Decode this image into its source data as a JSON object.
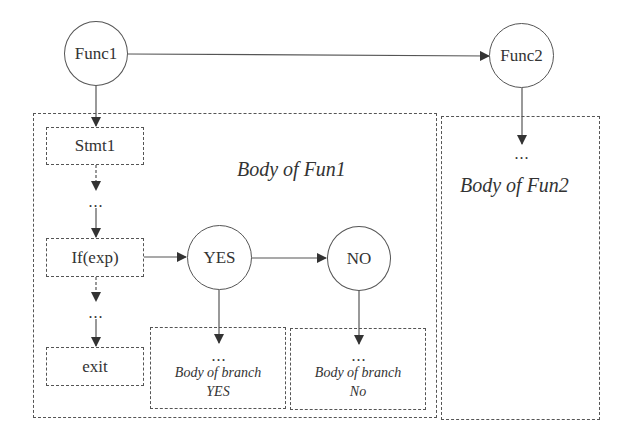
{
  "diagram": {
    "type": "function-call-flow",
    "nodes": {
      "func1": {
        "label": "Func1",
        "shape": "circle"
      },
      "func2": {
        "label": "Func2",
        "shape": "circle"
      },
      "yes": {
        "label": "YES",
        "shape": "circle"
      },
      "no": {
        "label": "NO",
        "shape": "circle"
      },
      "stmt1": {
        "label": "Stmt1",
        "shape": "dashed-rect"
      },
      "if_exp": {
        "label": "If(exp)",
        "shape": "dashed-rect"
      },
      "exit": {
        "label": "exit",
        "shape": "dashed-rect"
      }
    },
    "regions": {
      "body_fun1": {
        "label": "Body of Fun1"
      },
      "body_fun2": {
        "label": "Body of Fun2",
        "ellipsis": "..."
      },
      "branch_yes": {
        "ellipsis": "...",
        "line1": "Body of branch",
        "line2": "YES"
      },
      "branch_no": {
        "ellipsis": "...",
        "line1": "Body of branch",
        "line2": "No"
      }
    },
    "ellipses": {
      "after_stmt1": "...",
      "after_if": "..."
    },
    "edges": [
      {
        "from": "Func1",
        "to": "Func2",
        "style": "solid"
      },
      {
        "from": "Func1",
        "to": "Stmt1",
        "style": "solid"
      },
      {
        "from": "Func2",
        "to": "Body of Fun2",
        "style": "solid"
      },
      {
        "from": "Stmt1",
        "to": "...",
        "style": "dashed"
      },
      {
        "from": "...",
        "to": "If(exp)",
        "style": "solid"
      },
      {
        "from": "If(exp)",
        "to": "YES",
        "style": "solid"
      },
      {
        "from": "YES",
        "to": "NO",
        "style": "solid"
      },
      {
        "from": "YES",
        "to": "Body of branch YES",
        "style": "solid"
      },
      {
        "from": "NO",
        "to": "Body of branch No",
        "style": "solid"
      },
      {
        "from": "If(exp)",
        "to": "...",
        "style": "dashed"
      },
      {
        "from": "...",
        "to": "exit",
        "style": "solid"
      }
    ],
    "colors": {
      "stroke": "#555555",
      "text": "#333333",
      "background": "#ffffff"
    }
  }
}
